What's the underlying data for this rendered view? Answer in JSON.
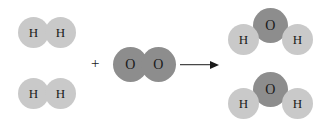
{
  "diagram": {
    "equation": "2 H2 + O2 -> 2 H2O",
    "background_color": "#ffffff",
    "colors": {
      "hydrogen_atom": "#c9c9c9",
      "oxygen_atom": "#8d8d8d",
      "label_text": "#1a1a1a",
      "arrow": "#1a1a1a"
    },
    "operators": {
      "plus": "+",
      "arrow_name": "reaction-arrow"
    },
    "reactants": [
      {
        "name": "hydrogen-molecule-1",
        "formula": "H2",
        "atoms": [
          {
            "label": "H",
            "element": "hydrogen"
          },
          {
            "label": "H",
            "element": "hydrogen"
          }
        ]
      },
      {
        "name": "hydrogen-molecule-2",
        "formula": "H2",
        "atoms": [
          {
            "label": "H",
            "element": "hydrogen"
          },
          {
            "label": "H",
            "element": "hydrogen"
          }
        ]
      },
      {
        "name": "oxygen-molecule",
        "formula": "O2",
        "atoms": [
          {
            "label": "O",
            "element": "oxygen"
          },
          {
            "label": "O",
            "element": "oxygen"
          }
        ]
      }
    ],
    "products": [
      {
        "name": "water-molecule-1",
        "formula": "H2O",
        "atoms": [
          {
            "label": "O",
            "element": "oxygen"
          },
          {
            "label": "H",
            "element": "hydrogen"
          },
          {
            "label": "H",
            "element": "hydrogen"
          }
        ]
      },
      {
        "name": "water-molecule-2",
        "formula": "H2O",
        "atoms": [
          {
            "label": "O",
            "element": "oxygen"
          },
          {
            "label": "H",
            "element": "hydrogen"
          },
          {
            "label": "H",
            "element": "hydrogen"
          }
        ]
      }
    ]
  }
}
